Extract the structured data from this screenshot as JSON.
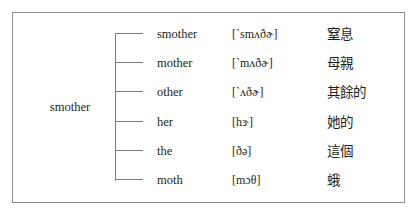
{
  "figure": {
    "type": "word-family-tree",
    "root": {
      "label": "smother"
    },
    "border_color": "#8c8c8c",
    "line_color": "#7d7d7d",
    "text_color": "#231f20",
    "background": "#ffffff",
    "columns": {
      "word": "word",
      "ipa": "pronunciation",
      "gloss": "chinese-gloss"
    },
    "branches": [
      {
        "word": "smother",
        "ipa": "[ˋsmʌðɚ]",
        "gloss": "窒息"
      },
      {
        "word": "mother",
        "ipa": "[ˋmʌðɚ]",
        "gloss": "母親"
      },
      {
        "word": "other",
        "ipa": "[ˋʌðɚ]",
        "gloss": "其餘的"
      },
      {
        "word": "her",
        "ipa": "[hɝ]",
        "gloss": "她的"
      },
      {
        "word": "the",
        "ipa": "[ðə]",
        "gloss": "這個"
      },
      {
        "word": "moth",
        "ipa": "[mɔθ]",
        "gloss": "蛾"
      }
    ]
  }
}
